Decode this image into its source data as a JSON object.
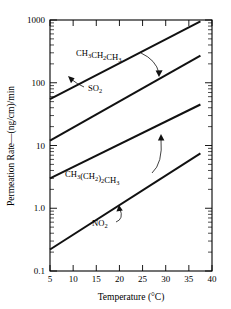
{
  "chart_data": {
    "type": "line",
    "title": "",
    "xlabel": "Temperature (°C)",
    "ylabel": "Permeation Rate—(ng/cm)/min",
    "xlim": [
      5,
      40
    ],
    "ylim": [
      0.1,
      1000
    ],
    "yscale": "log",
    "xscale": "linear",
    "grid": false,
    "legend": "inline-annotations",
    "xticks": [
      5,
      10,
      15,
      20,
      25,
      30,
      35,
      40
    ],
    "xtick_labels": [
      "5",
      "10",
      "15",
      "20",
      "25",
      "30",
      "35",
      "40"
    ],
    "yticks": [
      0.1,
      1.0,
      10,
      100,
      1000
    ],
    "ytick_labels": [
      "0.1",
      "1.0",
      "10",
      "100",
      "1000"
    ],
    "series": [
      {
        "name": "CH3CH2CH3",
        "label_text": "CH3CH2CH3",
        "label_parts": [
          {
            "t": "CH",
            "sub": false
          },
          {
            "t": "3",
            "sub": true
          },
          {
            "t": "CH",
            "sub": false
          },
          {
            "t": "2",
            "sub": true
          },
          {
            "t": "CH",
            "sub": false
          },
          {
            "t": "3",
            "sub": true
          }
        ],
        "x": [
          5,
          37.5
        ],
        "y": [
          55,
          950
        ]
      },
      {
        "name": "SO2",
        "label_text": "SO2",
        "label_parts": [
          {
            "t": "SO",
            "sub": false
          },
          {
            "t": "2",
            "sub": true
          }
        ],
        "x": [
          5,
          37.5
        ],
        "y": [
          12,
          270
        ]
      },
      {
        "name": "CH3(CH2)2CH3",
        "label_text": "CH3(CH2)2CH3",
        "label_parts": [
          {
            "t": "CH",
            "sub": false
          },
          {
            "t": "3",
            "sub": true
          },
          {
            "t": "(CH",
            "sub": false
          },
          {
            "t": "2",
            "sub": true
          },
          {
            "t": ")",
            "sub": false
          },
          {
            "t": "2",
            "sub": true
          },
          {
            "t": "CH",
            "sub": false
          },
          {
            "t": "3",
            "sub": true
          }
        ],
        "x": [
          5,
          37.5
        ],
        "y": [
          3.0,
          45
        ]
      },
      {
        "name": "NO2",
        "label_text": "NO2",
        "label_parts": [
          {
            "t": "NO",
            "sub": false
          },
          {
            "t": "2",
            "sub": true
          }
        ],
        "x": [
          5,
          37.5
        ],
        "y": [
          0.22,
          7.5
        ]
      }
    ],
    "annotations": [
      {
        "text": "CH3CH2CH3",
        "target_series": "CH3CH2CH3"
      },
      {
        "text": "SO2",
        "target_series": "SO2"
      },
      {
        "text": "CH3(CH2)2CH3",
        "target_series": "CH3(CH2)2CH3"
      },
      {
        "text": "NO2",
        "target_series": "NO2"
      }
    ]
  },
  "axes": {
    "y_title_main": "Permeation Rate",
    "y_title_dash": "—",
    "y_title_unit": "(ng/cm)/min",
    "x_title": "Temperature (°C)"
  }
}
